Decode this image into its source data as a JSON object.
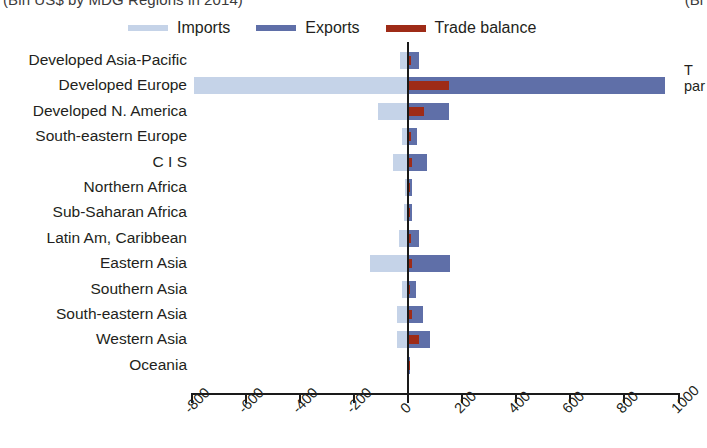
{
  "title": {
    "main_clipped": "(Bln US$ by MDG Regions in 2014)",
    "right_clipped": "(Bl"
  },
  "legend": {
    "items": [
      {
        "label": "Imports",
        "color": "#c5d3e8",
        "icon": "legend-line-imports"
      },
      {
        "label": "Exports",
        "color": "#5f6fa8",
        "icon": "legend-line-exports"
      },
      {
        "label": "Trade balance",
        "color": "#9e2b17",
        "icon": "legend-line-trade-balance"
      }
    ]
  },
  "right_note": {
    "line1": "T",
    "line2": "par"
  },
  "chart_data": {
    "type": "bar",
    "orientation": "horizontal",
    "title": "(Bln US$ by MDG Regions in 2014)",
    "xlabel": "",
    "ylabel": "",
    "xlim": [
      -900,
      1000
    ],
    "xticks": [
      -800,
      -600,
      -400,
      -200,
      0,
      200,
      400,
      600,
      800,
      1000
    ],
    "xtick_labels": [
      "-800",
      "-600",
      "-400",
      "-200",
      "0",
      "200",
      "400",
      "600",
      "800",
      "1000"
    ],
    "grid": false,
    "legend_position": "top",
    "zero_line": 0,
    "categories": [
      "Developed Asia-Pacific",
      "Developed Europe",
      "Developed N. America",
      "South-eastern Europe",
      "C I S",
      "Northern Africa",
      "Sub-Saharan Africa",
      "Latin Am, Caribbean",
      "Eastern Asia",
      "Southern Asia",
      "South-eastern Asia",
      "Western Asia",
      "Oceania"
    ],
    "series": [
      {
        "name": "Imports",
        "color": "#c5d3e8",
        "values": [
          -28,
          -790,
          -110,
          -22,
          -55,
          -12,
          -14,
          -32,
          -140,
          -22,
          -42,
          -40,
          -4
        ]
      },
      {
        "name": "Exports",
        "color": "#5f6fa8",
        "values": [
          40,
          950,
          150,
          32,
          70,
          14,
          16,
          42,
          155,
          28,
          55,
          82,
          6
        ]
      },
      {
        "name": "Trade balance",
        "color": "#9e2b17",
        "values": [
          12,
          150,
          60,
          10,
          15,
          3,
          3,
          10,
          15,
          6,
          13,
          42,
          2
        ]
      }
    ]
  },
  "axis_geometry": {
    "zero_px": 408,
    "px_per_unit": 0.2705,
    "plot_left_px": 190,
    "plot_right_px": 680
  }
}
